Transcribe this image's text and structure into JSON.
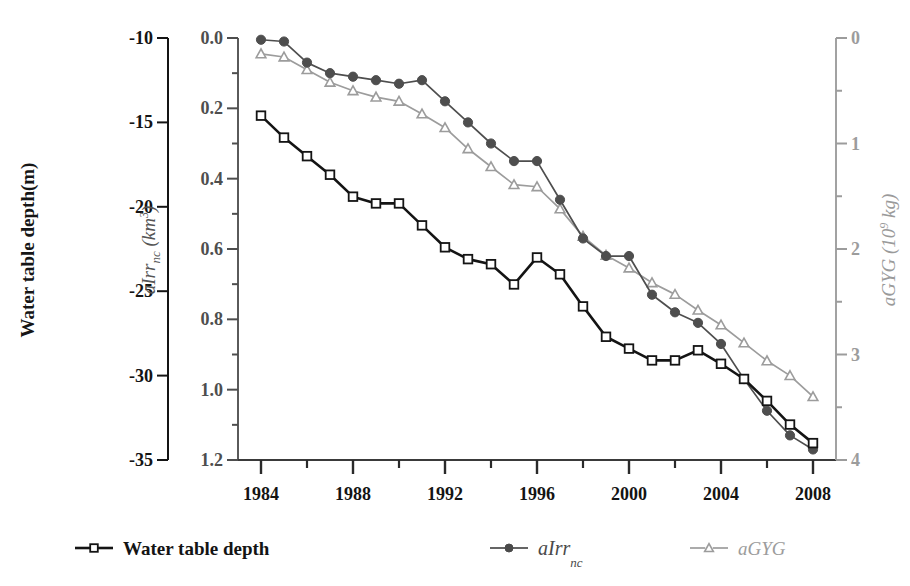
{
  "chart_data": {
    "type": "line",
    "title": "",
    "xlabel": "",
    "x": [
      1984,
      1985,
      1986,
      1987,
      1988,
      1989,
      1990,
      1991,
      1992,
      1993,
      1994,
      1995,
      1996,
      1997,
      1998,
      1999,
      2000,
      2001,
      2002,
      2003,
      2004,
      2005,
      2006,
      2007,
      2008
    ],
    "xlim": [
      1983,
      2009
    ],
    "x_ticks_major": [
      1984,
      1988,
      1992,
      1996,
      2000,
      2004,
      2008
    ],
    "x_ticks_minor": [
      1986,
      1990,
      1994,
      1998,
      2002,
      2006
    ],
    "grid": false,
    "legend_position": "below",
    "axes": [
      {
        "id": "water-table-depth",
        "side": "left-outer",
        "label": "Water table depth(m)",
        "unit": "m",
        "ticks": [
          -10,
          -15,
          -20,
          -25,
          -30,
          -35
        ],
        "tick_labels": [
          "-10",
          "-15",
          "-20",
          "-25",
          "-30",
          "-35"
        ],
        "lim": [
          -10,
          -35
        ],
        "color": "#141414"
      },
      {
        "id": "aIrr-nc",
        "side": "left-inner",
        "label_main": "aIrr",
        "label_sub": "nc",
        "label_unit_open": " (km",
        "label_unit_sup": "3",
        "label_unit_close": ")",
        "ticks": [
          0.0,
          0.2,
          0.4,
          0.6,
          0.8,
          1.0,
          1.2
        ],
        "tick_labels": [
          "0.0",
          "0.2",
          "0.4",
          "0.6",
          "0.8",
          "1.0",
          "1.2"
        ],
        "lim": [
          0.0,
          1.2
        ],
        "color": "#4e4e4e"
      },
      {
        "id": "aGYG",
        "side": "right",
        "label_main": "aGYG",
        "label_unit_open": " (10",
        "label_unit_sup": "9",
        "label_unit_close": " kg)",
        "ticks": [
          0,
          1,
          2,
          3,
          4
        ],
        "tick_labels": [
          "0",
          "1",
          "2",
          "3",
          "4"
        ],
        "lim": [
          0,
          4
        ],
        "color": "#9c9c9c"
      }
    ],
    "series": [
      {
        "name": "Water table depth",
        "axis": "water-table-depth",
        "marker": "open-square",
        "color": "#141414",
        "values": [
          -14.6,
          -15.9,
          -17.0,
          -18.1,
          -19.4,
          -19.8,
          -19.8,
          -21.1,
          -22.4,
          -23.1,
          -23.4,
          -24.6,
          -23.0,
          -24.0,
          -25.9,
          -27.7,
          -28.4,
          -29.1,
          -29.1,
          -28.5,
          -29.3,
          -30.2,
          -31.5,
          -32.9,
          -34.0
        ]
      },
      {
        "name": "aIrr_nc",
        "axis": "aIrr-nc",
        "marker": "filled-circle",
        "color": "#4e4e4e",
        "values": [
          0.005,
          0.01,
          0.07,
          0.1,
          0.11,
          0.12,
          0.13,
          0.12,
          0.18,
          0.24,
          0.3,
          0.35,
          0.35,
          0.46,
          0.57,
          0.62,
          0.62,
          0.73,
          0.78,
          0.81,
          0.87,
          0.97,
          1.06,
          1.13,
          1.17
        ]
      },
      {
        "name": "aGYG",
        "axis": "aGYG",
        "marker": "open-triangle",
        "color": "#9c9c9c",
        "values": [
          0.15,
          0.18,
          0.3,
          0.42,
          0.5,
          0.56,
          0.6,
          0.72,
          0.85,
          1.05,
          1.22,
          1.39,
          1.41,
          1.62,
          1.88,
          2.06,
          2.18,
          2.32,
          2.43,
          2.58,
          2.72,
          2.89,
          3.06,
          3.2,
          3.4
        ]
      }
    ]
  },
  "legend": {
    "items": [
      {
        "label": "Water table depth",
        "marker": "open-square",
        "color": "#141414",
        "style": "dark"
      },
      {
        "label_main": "aIrr",
        "label_sub": "nc",
        "marker": "filled-circle",
        "color": "#4a4a4a",
        "style": "mid"
      },
      {
        "label_main": "aGYG",
        "marker": "open-triangle",
        "color": "#9c9c9c",
        "style": "light"
      }
    ]
  }
}
